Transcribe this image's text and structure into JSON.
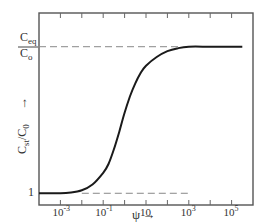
{
  "chart_data": {
    "type": "line",
    "title": "",
    "xscale": "log",
    "xlim_log10": [
      -4.0,
      6.0
    ],
    "xlabel": "ψ",
    "xlabel_arrow": "→",
    "ylabel": "C_st/C_0",
    "ylabel_arrow": "→",
    "ylevels": {
      "low": {
        "label": "1",
        "value": 1
      },
      "high": {
        "label_top": "C",
        "label_top_sub": "eq",
        "label_bottom": "C",
        "label_bottom_sub": "o",
        "value": "Ceq/Co"
      }
    },
    "ylim_fraction": [
      -0.08,
      1.23
    ],
    "x_ticks_log10": [
      -3,
      -2,
      -1,
      0,
      1,
      2,
      3,
      4,
      5
    ],
    "x_tick_labels": [
      {
        "log10": -3,
        "base": "10",
        "exp": "-3"
      },
      {
        "log10": -1,
        "base": "10",
        "exp": "-1"
      },
      {
        "log10": 1,
        "base": "10",
        "exp": ""
      },
      {
        "log10": 3,
        "base": "10",
        "exp": "3"
      },
      {
        "log10": 5,
        "base": "10",
        "exp": "5"
      }
    ],
    "series": [
      {
        "name": "C_st/C_0 vs psi",
        "description": "sigmoid rising from 1 to Ceq/Co",
        "x_log10": [
          -4.0,
          -3.0,
          -2.5,
          -2.0,
          -1.5,
          -1.0,
          -0.75,
          -0.5,
          -0.25,
          0.0,
          0.25,
          0.5,
          0.75,
          1.0,
          1.5,
          2.0,
          2.5,
          3.0,
          4.0,
          5.0,
          5.5
        ],
        "y_fraction": [
          0.0,
          0.0,
          0.005,
          0.02,
          0.06,
          0.14,
          0.2,
          0.3,
          0.42,
          0.55,
          0.66,
          0.75,
          0.82,
          0.87,
          0.93,
          0.97,
          0.99,
          1.0,
          1.0,
          1.0,
          1.0
        ]
      }
    ],
    "reference_lines": [
      {
        "name": "Ceq/Co level",
        "y_fraction": 1.0,
        "x_log10_range": [
          -4.0,
          2.6
        ],
        "style": "dashed"
      },
      {
        "name": "unity level",
        "y_fraction": 0.0,
        "x_log10_range": [
          -2.0,
          3.0
        ],
        "style": "dashed"
      }
    ],
    "grid": false,
    "legend": "none"
  }
}
